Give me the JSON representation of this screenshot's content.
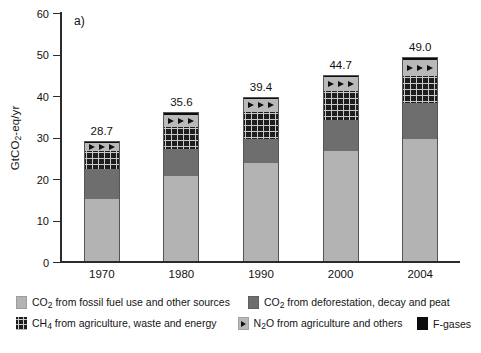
{
  "panel_label": "a)",
  "axis": {
    "y_title_pre": "GtCO",
    "y_title_sub": "2",
    "y_title_post": "-eq/yr",
    "y_ticks": [
      "0",
      "10",
      "20",
      "30",
      "40",
      "50",
      "60"
    ],
    "x_labels": [
      "1970",
      "1980",
      "1990",
      "2000",
      "2004"
    ]
  },
  "legend": {
    "items": [
      {
        "key": "co2foss",
        "pre": "CO",
        "sub": "2",
        "post": " from fossil fuel use and other sources",
        "swatch": "co2-fossil-swatch"
      },
      {
        "key": "co2defor",
        "pre": "CO",
        "sub": "2",
        "post": " from deforestation, decay and peat",
        "swatch": "co2-deforestation-swatch"
      },
      {
        "key": "ch4",
        "pre": "CH",
        "sub": "4",
        "post": " from agriculture, waste and energy",
        "swatch": "ch4-swatch"
      },
      {
        "key": "n2o",
        "pre": "N",
        "sub": "2",
        "post": "O from agriculture and others",
        "swatch": "n2o-swatch"
      },
      {
        "key": "fgas",
        "pre": "F-gases",
        "sub": "",
        "post": "",
        "swatch": "f-gases-swatch"
      }
    ]
  },
  "chart_data": {
    "type": "bar",
    "subtype": "stacked",
    "title": "",
    "panel": "a)",
    "xlabel": "",
    "ylabel": "GtCO2-eq/yr",
    "ylim": [
      0,
      60
    ],
    "ytick_step": 10,
    "grid": false,
    "legend_position": "below",
    "categories": [
      "1970",
      "1980",
      "1990",
      "2000",
      "2004"
    ],
    "totals": [
      28.7,
      35.6,
      39.4,
      44.7,
      49.0
    ],
    "total_labels": [
      "28.7",
      "35.6",
      "39.4",
      "44.7",
      "49.0"
    ],
    "series": [
      {
        "name": "CO2 from fossil fuel use and other sources",
        "color": "#b3b3b3",
        "pattern": "solid-light-grey",
        "values": [
          15.0,
          20.5,
          23.6,
          26.5,
          29.3
        ]
      },
      {
        "name": "CO2 from deforestation, decay and peat",
        "color": "#6e6e6e",
        "pattern": "solid-dark-grey",
        "values": [
          7.1,
          6.5,
          5.9,
          7.5,
          8.7
        ]
      },
      {
        "name": "CH4 from agriculture, waste and energy",
        "color": "#1e1e1e",
        "pattern": "checkered",
        "values": [
          4.5,
          5.3,
          6.5,
          7.0,
          6.5
        ]
      },
      {
        "name": "N2O from agriculture and others",
        "color": "#b9b9b9",
        "pattern": "triangles",
        "values": [
          1.8,
          3.0,
          3.1,
          3.4,
          4.0
        ]
      },
      {
        "name": "F-gases",
        "color": "#0d0d0d",
        "pattern": "solid-black",
        "values": [
          0.3,
          0.3,
          0.3,
          0.3,
          0.5
        ]
      }
    ]
  }
}
